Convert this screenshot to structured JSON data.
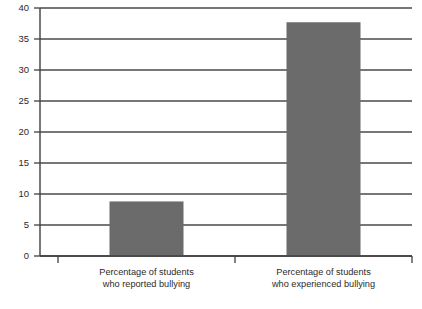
{
  "chart_data": {
    "type": "bar",
    "title": "",
    "subtitle": "",
    "xlabel": "",
    "ylabel": "",
    "categories": [
      "Percentage of students who reported bullying",
      "Percentage of students who experienced bullying"
    ],
    "category_lines": [
      [
        "Percentage of students",
        "who reported bullying"
      ],
      [
        "Percentage of students",
        "who experienced bullying"
      ]
    ],
    "values": [
      8.8,
      37.7
    ],
    "ylim": [
      0,
      40
    ],
    "ytick_step": 5,
    "yticks": [
      0,
      5,
      10,
      15,
      20,
      25,
      30,
      35,
      40
    ],
    "ytick_labels": [
      "0",
      "5",
      "10",
      "15",
      "20",
      "25",
      "30",
      "35",
      "40"
    ],
    "grid": true,
    "grid_axis": "y",
    "legend": false,
    "legend_position": "none",
    "bar_color": "#6b6b6b",
    "grid_color": "#4a4a4a",
    "axis_color": "#3f3f3f",
    "text_color": "#2b2b2b",
    "background_color": "#ffffff"
  }
}
